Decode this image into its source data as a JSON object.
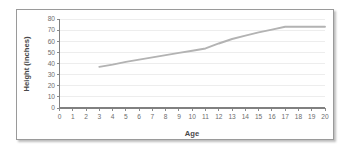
{
  "chart_data": {
    "type": "line",
    "title": "",
    "xlabel": "Age",
    "ylabel": "Height (inches)",
    "xlim": [
      0,
      20
    ],
    "ylim": [
      0,
      80
    ],
    "grid": true,
    "legend": false,
    "legend_position": "none",
    "line_color": "#b3b3b3",
    "x_ticks": [
      "0",
      "1",
      "2",
      "3",
      "4",
      "5",
      "6",
      "7",
      "8",
      "9",
      "10",
      "11",
      "12",
      "13",
      "14",
      "15",
      "16",
      "17",
      "18",
      "19",
      "20"
    ],
    "y_ticks": [
      "0",
      "10",
      "20",
      "30",
      "40",
      "50",
      "60",
      "70",
      "80"
    ],
    "x": [
      3,
      4,
      5,
      6,
      7,
      8,
      9,
      10,
      11,
      12,
      13,
      14,
      15,
      16,
      17,
      18,
      19,
      20
    ],
    "values": [
      37,
      39,
      41.5,
      43.5,
      45.5,
      47.5,
      49.5,
      51.5,
      53.5,
      58,
      62,
      65,
      68,
      70.5,
      73,
      73,
      73,
      73
    ],
    "series": [
      {
        "name": "Height",
        "values": [
          37,
          39,
          41.5,
          43.5,
          45.5,
          47.5,
          49.5,
          51.5,
          53.5,
          58,
          62,
          65,
          68,
          70.5,
          73,
          73,
          73,
          73
        ]
      }
    ]
  },
  "figure": {
    "border_color": "#9a9a9a",
    "background": "#ffffff"
  }
}
